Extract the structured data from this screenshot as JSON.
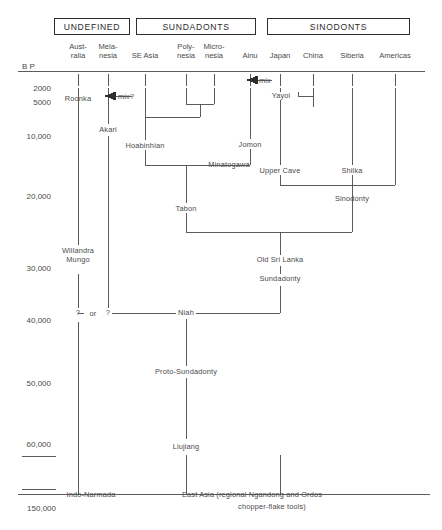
{
  "figure": {
    "axis_label": "B P",
    "axis_ticks": [
      "2000",
      "5000",
      "10,000",
      "20,000",
      "30,000",
      "40,000",
      "50,000",
      "60,000",
      "150,000"
    ],
    "line_color": "#4a4a4a",
    "text_color": "#4a4a4a"
  },
  "groups": [
    {
      "name": "UNDEFINED",
      "label": "UNDEFINED"
    },
    {
      "name": "SUNDADONTS",
      "label": "SUNDADONTS"
    },
    {
      "name": "SINODONTS",
      "label": "SINODONTS"
    }
  ],
  "columns": [
    {
      "id": "australia",
      "line1": "Aust-",
      "line2": "ralia"
    },
    {
      "id": "melanesia",
      "line1": "Mela-",
      "line2": "nesia"
    },
    {
      "id": "se-asia",
      "line1": "",
      "line2": "SE Asia"
    },
    {
      "id": "polynesia",
      "line1": "Poly-",
      "line2": "nesia"
    },
    {
      "id": "micronesia",
      "line1": "Micro-",
      "line2": "nesia"
    },
    {
      "id": "ainu",
      "line1": "",
      "line2": "Ainu"
    },
    {
      "id": "japan",
      "line1": "",
      "line2": "Japan"
    },
    {
      "id": "china",
      "line1": "",
      "line2": "China"
    },
    {
      "id": "siberia",
      "line1": "",
      "line2": "Siberia"
    },
    {
      "id": "americas",
      "line1": "",
      "line2": "Americas"
    }
  ],
  "nodes": [
    {
      "id": "roonka",
      "label": "Roonka"
    },
    {
      "id": "mix-question",
      "label": "mix?"
    },
    {
      "id": "mix",
      "label": "mix"
    },
    {
      "id": "yayoi",
      "label": "Yayoi"
    },
    {
      "id": "akari",
      "label": "Akari"
    },
    {
      "id": "hoabinhian",
      "label": "Hoabinhian"
    },
    {
      "id": "jomon",
      "label": "Jomon"
    },
    {
      "id": "upper-cave",
      "label": "Upper Cave"
    },
    {
      "id": "shilka",
      "label": "Shilka"
    },
    {
      "id": "minatogawa",
      "label": "Minatogawa"
    },
    {
      "id": "sinodonty",
      "label": "Sinodonty"
    },
    {
      "id": "tabon",
      "label": "Tabon"
    },
    {
      "id": "old-sri-lanka",
      "label": "Old Sri Lanka"
    },
    {
      "id": "willandra-mungo",
      "label": "Willandra\nMungo"
    },
    {
      "id": "willandra",
      "label": "Willandra"
    },
    {
      "id": "mungo",
      "label": "Mungo"
    },
    {
      "id": "sundadonty",
      "label": "Sundadonty"
    },
    {
      "id": "q-left",
      "label": "?"
    },
    {
      "id": "or",
      "label": "or"
    },
    {
      "id": "q-right",
      "label": "?"
    },
    {
      "id": "niah",
      "label": "Niah"
    },
    {
      "id": "proto-sundadonty",
      "label": "Proto-Sundadonty"
    },
    {
      "id": "liujiang",
      "label": "Liujiang"
    },
    {
      "id": "indo-narmada",
      "label": "Indo-Narmada"
    },
    {
      "id": "east-asia-1",
      "label": "East Asia (regional Ngandong and Ordos"
    },
    {
      "id": "east-asia-2",
      "label": "chopper-flake tools)"
    }
  ]
}
